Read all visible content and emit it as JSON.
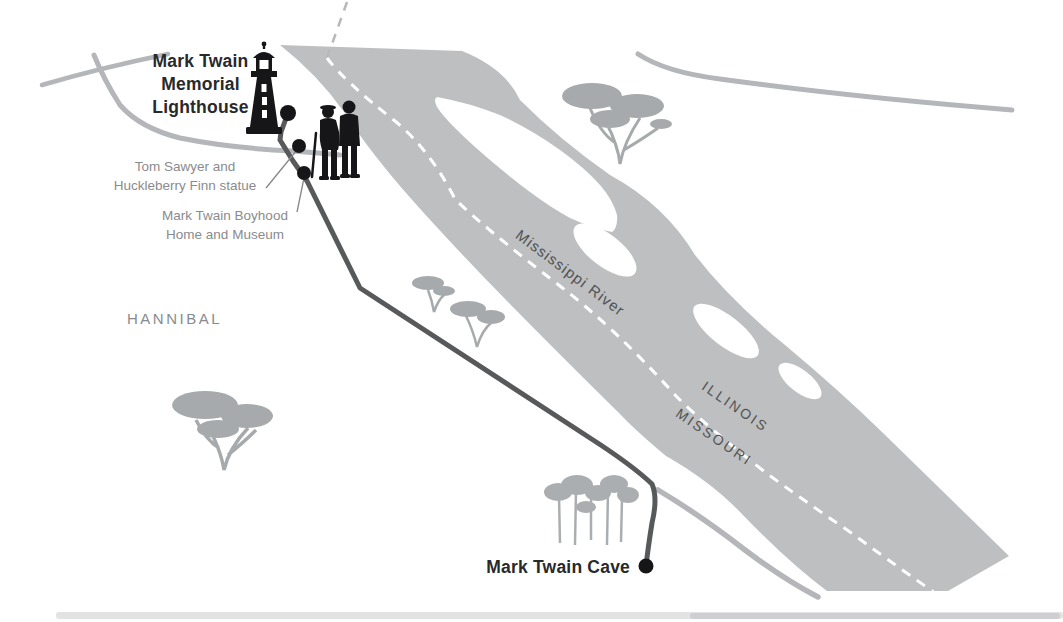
{
  "map": {
    "title": "Hannibal Missouri - Mark Twain landmarks illustrated map",
    "labels": {
      "poi_lighthouse": {
        "line1": "Mark Twain",
        "line2": "Memorial",
        "line3": "Lighthouse"
      },
      "poi_statue": {
        "line1": "Tom Sawyer and",
        "line2": "Huckleberry Finn statue"
      },
      "poi_boyhood_home": {
        "line1": "Mark Twain Boyhood",
        "line2": "Home and Museum"
      },
      "city": "HANNIBAL",
      "river": "Mississippi River",
      "state_northeast": "ILLINOIS",
      "state_southwest": "MISSOURI",
      "poi_cave": "Mark Twain Cave"
    },
    "colors": {
      "river": "#bdbfc1",
      "island": "#ffffff",
      "boundary_dash_on_river": "#ffffff",
      "boundary_dash_on_land": "#b7b9bb",
      "road": "#b4b6b9",
      "route": "#58595b",
      "tree": "#a7aaac",
      "ink_black": "#161618",
      "label_dark": "#28292b",
      "label_gray": "#8a8b8e",
      "state_text": "#515254"
    },
    "icons": [
      "lighthouse-icon",
      "statue-icon",
      "acacia-tree-icon",
      "pine-grove-icon",
      "poi-dot",
      "route-line",
      "road-line",
      "river-shape",
      "state-boundary-dashed-line"
    ]
  }
}
